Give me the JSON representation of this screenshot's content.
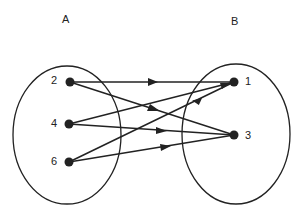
{
  "diagram": {
    "type": "mapping",
    "sets": [
      {
        "name": "A",
        "elements": [
          "2",
          "4",
          "6"
        ]
      },
      {
        "name": "B",
        "elements": [
          "1",
          "3"
        ]
      }
    ],
    "arrows": [
      {
        "from": "2",
        "to": "1"
      },
      {
        "from": "2",
        "to": "3"
      },
      {
        "from": "4",
        "to": "1"
      },
      {
        "from": "4",
        "to": "3"
      },
      {
        "from": "6",
        "to": "1"
      },
      {
        "from": "6",
        "to": "3"
      }
    ],
    "labels": {
      "setA": "A",
      "setB": "B",
      "a2": "2",
      "a4": "4",
      "a6": "6",
      "b1": "1",
      "b3": "3"
    },
    "colors": {
      "stroke": "#222222",
      "background": "#ffffff"
    }
  }
}
